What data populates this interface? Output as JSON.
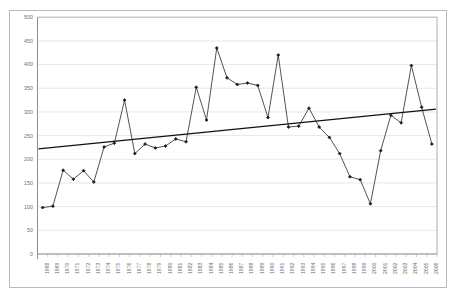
{
  "chart_data": {
    "type": "line",
    "title": "",
    "subtitle": "",
    "xlabel": "",
    "ylabel": "",
    "grid": true,
    "legend": false,
    "legend_position": "none",
    "ylim": [
      0,
      500
    ],
    "yticks": [
      0,
      50,
      100,
      150,
      200,
      250,
      300,
      350,
      400,
      450,
      500
    ],
    "categories": [
      "1968",
      "1969",
      "1970",
      "1971",
      "1972",
      "1973",
      "1974",
      "1975",
      "1976",
      "1977",
      "1978",
      "1979",
      "1980",
      "1981",
      "1982",
      "1983",
      "1984",
      "1985",
      "1986",
      "1987",
      "1988",
      "1989",
      "1990",
      "1991",
      "1992",
      "1993",
      "1994",
      "1995",
      "1996",
      "1997",
      "1998",
      "1999",
      "2000",
      "2001",
      "2002",
      "2003",
      "2004",
      "2005",
      "2006"
    ],
    "series": [
      {
        "name": "series-1",
        "marker": "diamond",
        "color": "#1a1a1a",
        "values": [
          98,
          101,
          177,
          158,
          176,
          152,
          226,
          234,
          325,
          212,
          232,
          224,
          228,
          243,
          237,
          352,
          283,
          435,
          372,
          358,
          361,
          356,
          288,
          420,
          268,
          270,
          308,
          268,
          246,
          212,
          163,
          157,
          106,
          218,
          293,
          277,
          398,
          310,
          232
        ]
      }
    ],
    "trendline": {
      "name": "linear-trendline",
      "color": "#111111",
      "start_value": 222,
      "end_value": 306
    },
    "annotations": []
  },
  "axis": {
    "y_tick_labels": [
      "500",
      "450",
      "400",
      "350",
      "300",
      "250",
      "200",
      "150",
      "100",
      "50",
      "0"
    ],
    "x_tick_labels": [
      "1968",
      "1969",
      "1970",
      "1971",
      "1972",
      "1973",
      "1974",
      "1975",
      "1976",
      "1977",
      "1978",
      "1979",
      "1980",
      "1981",
      "1982",
      "1983",
      "1984",
      "1985",
      "1986",
      "1987",
      "1988",
      "1989",
      "1990",
      "1991",
      "1992",
      "1993",
      "1994",
      "1995",
      "1996",
      "1997",
      "1998",
      "1999",
      "2000",
      "2001",
      "2002",
      "2003",
      "2004",
      "2005",
      "2006"
    ]
  },
  "colors": {
    "grid": "#d9d9d9",
    "axis": "#808080",
    "series": "#1a1a1a",
    "trend": "#111111",
    "frame": "#b9b9b9",
    "tick_text": "#6c6c6c",
    "background": "#ffffff"
  }
}
